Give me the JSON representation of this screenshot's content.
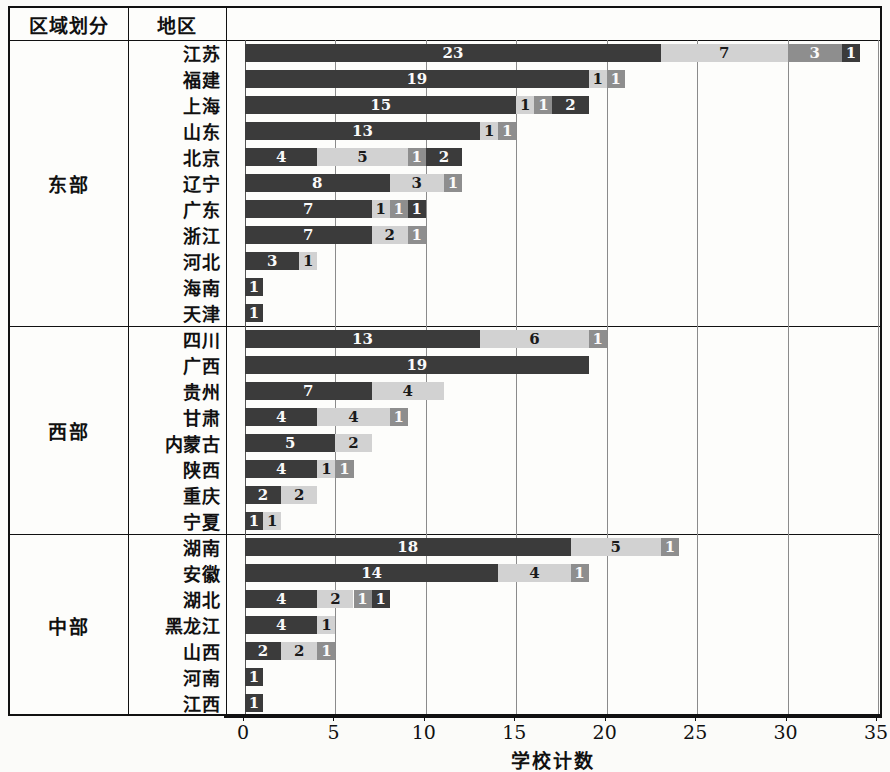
{
  "table": {
    "headers": [
      "区域划分",
      "地区",
      ""
    ],
    "region_col_label": "区域划分",
    "area_col_label": "地区"
  },
  "chart_data": {
    "type": "bar",
    "subtype": "stacked-horizontal",
    "title": "",
    "xlabel": "学校计数",
    "ylabel": "",
    "xlim": [
      0,
      35
    ],
    "xticks": [
      0,
      5,
      10,
      15,
      20,
      25,
      30,
      35
    ],
    "grid": true,
    "legend": "none",
    "series_colors": [
      "#3b3b3b",
      "#d2d2d2",
      "#8e8e8e",
      "#3b3b3b"
    ],
    "groups": [
      {
        "name": "东部",
        "rows": [
          {
            "area": "江苏",
            "segments": [
              23,
              7,
              3,
              1
            ]
          },
          {
            "area": "福建",
            "segments": [
              19,
              1,
              1
            ]
          },
          {
            "area": "上海",
            "segments": [
              15,
              1,
              1,
              2
            ]
          },
          {
            "area": "山东",
            "segments": [
              13,
              1,
              1
            ]
          },
          {
            "area": "北京",
            "segments": [
              4,
              5,
              1,
              2
            ]
          },
          {
            "area": "辽宁",
            "segments": [
              8,
              3,
              1
            ]
          },
          {
            "area": "广东",
            "segments": [
              7,
              1,
              1,
              1
            ]
          },
          {
            "area": "浙江",
            "segments": [
              7,
              2,
              1
            ]
          },
          {
            "area": "河北",
            "segments": [
              3,
              1
            ]
          },
          {
            "area": "海南",
            "segments": [
              1
            ]
          },
          {
            "area": "天津",
            "segments": [
              1
            ]
          }
        ]
      },
      {
        "name": "西部",
        "rows": [
          {
            "area": "四川",
            "segments": [
              13,
              6,
              1
            ]
          },
          {
            "area": "广西",
            "segments": [
              19
            ]
          },
          {
            "area": "贵州",
            "segments": [
              7,
              4
            ]
          },
          {
            "area": "甘肃",
            "segments": [
              4,
              4,
              1
            ]
          },
          {
            "area": "内蒙古",
            "segments": [
              5,
              2
            ]
          },
          {
            "area": "陕西",
            "segments": [
              4,
              1,
              1
            ]
          },
          {
            "area": "重庆",
            "segments": [
              2,
              2
            ]
          },
          {
            "area": "宁夏",
            "segments": [
              1,
              1
            ]
          }
        ]
      },
      {
        "name": "中部",
        "rows": [
          {
            "area": "湖南",
            "segments": [
              18,
              5,
              1
            ]
          },
          {
            "area": "安徽",
            "segments": [
              14,
              4,
              1
            ]
          },
          {
            "area": "湖北",
            "segments": [
              4,
              2,
              1,
              1
            ]
          },
          {
            "area": "黑龙江",
            "segments": [
              4,
              1
            ]
          },
          {
            "area": "山西",
            "segments": [
              2,
              2,
              1
            ]
          },
          {
            "area": "河南",
            "segments": [
              1
            ]
          },
          {
            "area": "江西",
            "segments": [
              1
            ]
          }
        ]
      }
    ]
  }
}
